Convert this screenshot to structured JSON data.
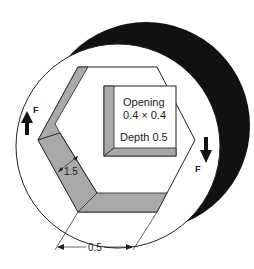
{
  "diagram": {
    "opening_label": "Opening",
    "opening_size": "0.4 × 0.4",
    "depth_label": "Depth 0.5",
    "force_left": "F",
    "force_right": "F",
    "wall_thickness": "1.5",
    "bottom_dimension": "0.5"
  },
  "colors": {
    "shaft_shadow": "#111111",
    "band_gray": "#a9a9a9",
    "line": "#222222",
    "background": "#ffffff"
  }
}
